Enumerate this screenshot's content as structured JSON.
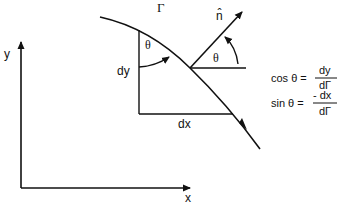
{
  "axes": {
    "x_label": "x",
    "y_label": "y"
  },
  "curve": {
    "label": "Γ"
  },
  "normal": {
    "label": "n̂"
  },
  "angles": {
    "theta_at_dy": "θ",
    "theta_at_normal": "θ"
  },
  "segments": {
    "dy_label": "dy",
    "dx_label": "dx"
  },
  "equations": {
    "cos_lhs": "cos θ =",
    "cos_num": "dy",
    "cos_den": "dΓ",
    "sin_lhs": "sin θ =",
    "sin_num": "- dx",
    "sin_den": "dΓ"
  },
  "colors": {
    "ink": "#111111",
    "background": "#ffffff"
  }
}
